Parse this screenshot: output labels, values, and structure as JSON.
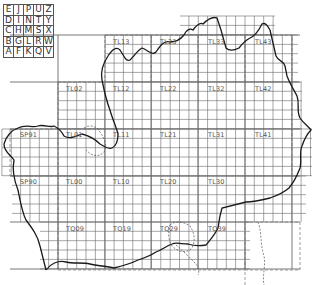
{
  "legend": {
    "rows": [
      [
        "E",
        "J",
        "P",
        "U",
        "Z"
      ],
      [
        "D",
        "I",
        "N",
        "T",
        "Y"
      ],
      [
        "C",
        "H",
        "M",
        "S",
        "X"
      ],
      [
        "B",
        "G",
        "L",
        "R",
        "W"
      ],
      [
        "A",
        "F",
        "K",
        "Q",
        "V"
      ]
    ]
  },
  "grid": {
    "major_x": [
      58,
      105,
      151,
      198,
      245,
      292
    ],
    "major_y": [
      35,
      82,
      129,
      176,
      222,
      269
    ],
    "cell": 9.35
  },
  "square_labels": [
    {
      "text": "TL13",
      "x": 113,
      "y": 44
    },
    {
      "text": "TL23",
      "x": 160,
      "y": 44
    },
    {
      "text": "TL33",
      "x": 208,
      "y": 44
    },
    {
      "text": "TL43",
      "x": 255,
      "y": 44
    },
    {
      "text": "TL02",
      "x": 66,
      "y": 91
    },
    {
      "text": "TL12",
      "x": 113,
      "y": 91
    },
    {
      "text": "TL22",
      "x": 160,
      "y": 91
    },
    {
      "text": "TL32",
      "x": 208,
      "y": 91
    },
    {
      "text": "TL42",
      "x": 255,
      "y": 91
    },
    {
      "text": "SP91",
      "x": 20,
      "y": 137
    },
    {
      "text": "TL01",
      "x": 66,
      "y": 137
    },
    {
      "text": "TL11",
      "x": 113,
      "y": 137
    },
    {
      "text": "TL21",
      "x": 160,
      "y": 137
    },
    {
      "text": "TL31",
      "x": 208,
      "y": 137
    },
    {
      "text": "TL41",
      "x": 255,
      "y": 137
    },
    {
      "text": "SP90",
      "x": 20,
      "y": 184
    },
    {
      "text": "TL00",
      "x": 66,
      "y": 184
    },
    {
      "text": "TL10",
      "x": 113,
      "y": 184
    },
    {
      "text": "TL20",
      "x": 160,
      "y": 184
    },
    {
      "text": "TL30",
      "x": 208,
      "y": 184
    },
    {
      "text": "TQ09",
      "x": 66,
      "y": 231
    },
    {
      "text": "TQ19",
      "x": 113,
      "y": 231
    },
    {
      "text": "TQ29",
      "x": 160,
      "y": 231
    },
    {
      "text": "TQ39",
      "x": 208,
      "y": 231
    }
  ],
  "colors": {
    "grid": "#6a6a6a",
    "boundary": "#1a1a1a",
    "dashed": "#777777",
    "text": "#555555"
  }
}
